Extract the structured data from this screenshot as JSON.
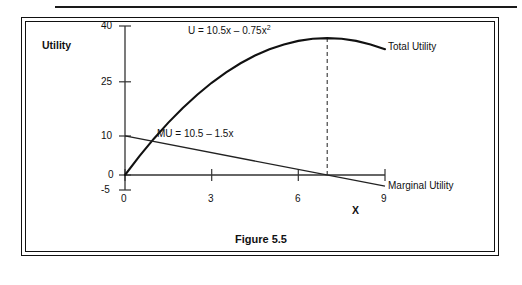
{
  "figure": {
    "caption": "Figure 5.5"
  },
  "chart_data": {
    "type": "line",
    "title": "",
    "xlabel": "X",
    "ylabel": "Utility",
    "xlim": [
      0,
      9
    ],
    "ylim": [
      -5,
      40
    ],
    "grid": false,
    "legend_position": "right-inline",
    "x_ticks": [
      "0",
      "3",
      "6",
      "9"
    ],
    "x_tick_values": [
      0,
      3,
      6,
      9
    ],
    "y_ticks": [
      "40",
      "25",
      "10",
      "0",
      "-5"
    ],
    "y_tick_values": [
      40,
      25,
      10,
      0,
      -5
    ],
    "annotations": [
      {
        "name": "total-utility-equation",
        "text_prefix": "U = 10.5x – 0.75x",
        "text_sup": "2",
        "x": 3.9,
        "y": 37
      },
      {
        "name": "marginal-utility-equation",
        "text": "MU = 10.5 – 1.5x",
        "x": 2.3,
        "y": 11.5
      },
      {
        "name": "peak-dashed-line",
        "type": "vline",
        "x": 7,
        "y_from": 0,
        "y_to": 36.75,
        "style": "dashed"
      }
    ],
    "series": [
      {
        "name": "Total Utility",
        "label": "Total Utility",
        "equation": "U = 10.5x - 0.75x^2",
        "style": "solid-thick",
        "x": [
          0,
          0.5,
          1,
          1.5,
          2,
          2.5,
          3,
          3.5,
          4,
          4.5,
          5,
          5.5,
          6,
          6.5,
          7,
          7.5,
          8,
          8.5,
          9
        ],
        "values": [
          0,
          5.0625,
          9.75,
          14.0625,
          18,
          21.5625,
          24.75,
          27.5625,
          30,
          32.0625,
          33.75,
          35.0625,
          36,
          36.5625,
          36.75,
          36.5625,
          36,
          35.0625,
          33.75
        ]
      },
      {
        "name": "Marginal Utility",
        "label": "Marginal Utility",
        "equation": "MU = 10.5 - 1.5x",
        "style": "solid-thin",
        "x": [
          0,
          9
        ],
        "values": [
          10.5,
          -3
        ]
      }
    ]
  }
}
